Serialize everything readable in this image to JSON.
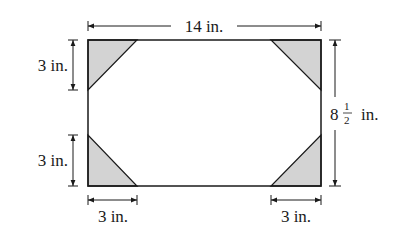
{
  "diagram": {
    "colors": {
      "stroke": "#1a1a1a",
      "shade": "#d3d3d3",
      "background": "#ffffff"
    },
    "labels": {
      "width": "14 in.",
      "height_whole": "8",
      "height_num": "1",
      "height_den": "2",
      "height_unit": "in.",
      "top_left_leg": "3 in.",
      "bottom_left_leg": "3 in.",
      "bottom_left_base": "3 in.",
      "bottom_right_base": "3 in."
    },
    "rectangle": {
      "width_in": 14,
      "height_in": 8.5
    },
    "corner_triangle_leg_in": 3
  }
}
